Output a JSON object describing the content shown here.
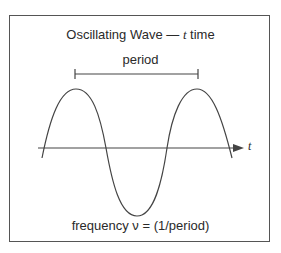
{
  "diagram": {
    "title_prefix": "Oscillating Wave — ",
    "title_var": "t",
    "title_suffix": " time",
    "period_label": "period",
    "axis_label": "t",
    "frequency_label": "frequency ν = (1/period)",
    "colors": {
      "line": "#444444",
      "frame": "#555555",
      "text": "#2a2a2a"
    }
  }
}
